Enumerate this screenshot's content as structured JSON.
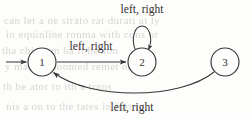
{
  "diagram": {
    "type": "finite-state-machine",
    "ink_color": "#3a3737",
    "background_color": "#fdfdfc",
    "states": [
      {
        "id": "1",
        "label": "1",
        "cx": 42,
        "cy": 62,
        "r": 14,
        "is_start": true
      },
      {
        "id": "2",
        "label": "2",
        "cx": 142,
        "cy": 62,
        "r": 14,
        "is_start": false
      },
      {
        "id": "3",
        "label": "3",
        "cx": 225,
        "cy": 62,
        "r": 14,
        "is_start": false
      }
    ],
    "transitions": [
      {
        "from": "start",
        "to": "1",
        "label": "",
        "shape": "start-arrow"
      },
      {
        "from": "1",
        "to": "2",
        "label": "left, right",
        "shape": "straight-horizontal"
      },
      {
        "from": "2",
        "to": "2",
        "label": "left, right",
        "shape": "self-loop-top"
      },
      {
        "from": "3",
        "to": "1",
        "label": "left, right",
        "shape": "curve-below"
      }
    ],
    "labels": {
      "top_loop": "left, right",
      "one_to_two": "left, right",
      "three_to_one": "left, right"
    }
  },
  "background_ghost_text": [
    "can  let a  ne  strato  rat  durati  at  ly",
    "in   equinline  ronma    with  cons  or",
    "tha  chine  an  ha  it  be  son",
    "y  mate  ar  roomed  remet  of  etal",
    "th  be  ator  to  ith  a  trans",
    "nis  a  on  to  the  tates  in  fort  ra"
  ]
}
